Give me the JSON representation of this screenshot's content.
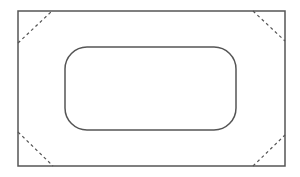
{
  "diagram": {
    "stroke_color": "#555555",
    "background": "#ffffff",
    "outer_rect": {
      "x": 18,
      "y": 11,
      "width": 267,
      "height": 155
    },
    "inner_rect": {
      "x": 65,
      "y": 47,
      "width": 171,
      "height": 83,
      "radius": 22
    },
    "corner_lines": [
      {
        "name": "top-left",
        "x1": 18,
        "y1": 43,
        "x2": 52,
        "y2": 11
      },
      {
        "name": "top-right",
        "x1": 253,
        "y1": 11,
        "x2": 285,
        "y2": 41
      },
      {
        "name": "bottom-left",
        "x1": 18,
        "y1": 132,
        "x2": 53,
        "y2": 166
      },
      {
        "name": "bottom-right",
        "x1": 253,
        "y1": 166,
        "x2": 285,
        "y2": 135
      }
    ]
  }
}
